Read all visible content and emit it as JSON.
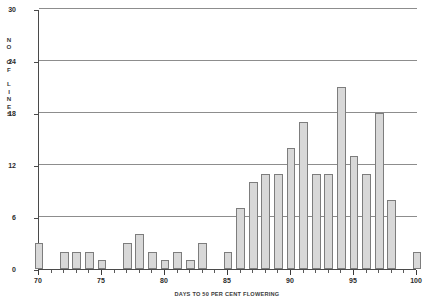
{
  "chart_data": {
    "type": "bar",
    "title": "",
    "subtitle": "",
    "xlabel": "DAYS TO 50 PER CENT FLOWERING",
    "ylabel": "NO OF LINES",
    "ylabel_letters": [
      "N",
      "O",
      "",
      "O",
      "F",
      "",
      "L",
      "I",
      "N",
      "E",
      "S"
    ],
    "xlim": [
      70,
      100
    ],
    "ylim": [
      0,
      30
    ],
    "ytick_values": [
      0,
      6,
      12,
      18,
      24,
      30
    ],
    "ytick_labels": [
      "0",
      "6",
      "12",
      "18",
      "24",
      "30"
    ],
    "xtick_values": [
      70,
      75,
      80,
      85,
      90,
      95,
      100
    ],
    "xtick_labels": [
      "70",
      "75",
      "80",
      "85",
      "90",
      "95",
      "100"
    ],
    "x_minor_step": 1,
    "grid": "horizontal",
    "legend": "none",
    "bar_fill": "#d8d8d8",
    "bar_border": "#7d7d7d",
    "axis_color": "#4a4a4a",
    "categories": [
      70,
      71,
      72,
      73,
      74,
      75,
      76,
      77,
      78,
      79,
      80,
      81,
      82,
      83,
      84,
      85,
      86,
      87,
      88,
      89,
      90,
      91,
      92,
      93,
      94,
      95,
      96,
      97,
      98,
      99,
      100
    ],
    "values": [
      3,
      0,
      2,
      2,
      2,
      1,
      0,
      3,
      4,
      2,
      1,
      2,
      1,
      3,
      0,
      2,
      7,
      10,
      11,
      11,
      14,
      17,
      11,
      11,
      21,
      13,
      11,
      18,
      8,
      0,
      2
    ]
  }
}
